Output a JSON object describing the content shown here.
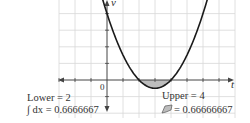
{
  "chart_data": {
    "type": "line",
    "title": "",
    "xlabel": "t",
    "ylabel": "v",
    "function": "v = (t - 2)(t - 4)",
    "xlim": [
      -8,
      8.3
    ],
    "ylim": [
      -4,
      9
    ],
    "x_tick_step": 1,
    "y_tick_step": 2,
    "grid": true,
    "origin_label": "0",
    "shaded_region": {
      "from": 2,
      "to": 4
    },
    "series": [
      {
        "name": "v(t)",
        "x": [
          -0.2,
          0,
          0.5,
          1,
          1.5,
          2,
          2.5,
          3,
          3.5,
          4,
          4.5,
          5,
          5.5,
          6,
          6.2
        ],
        "values": [
          9.24,
          8,
          5.25,
          3,
          1.25,
          0,
          -0.75,
          -1,
          -0.75,
          0,
          1.25,
          3,
          5.25,
          8,
          9.24
        ]
      }
    ],
    "annotations": {
      "lower": "Lower = 2",
      "integral": "∫ dx = 0.6666667",
      "upper": "Upper = 4",
      "area": "= 0.66666667"
    }
  },
  "colors": {
    "curve": "#1a1a1a",
    "grid": "#d8d8d8",
    "axis": "#444444",
    "shade": "#bdbdbd"
  }
}
